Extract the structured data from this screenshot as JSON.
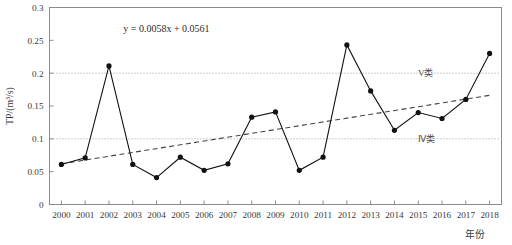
{
  "chart_data": {
    "type": "line",
    "title": "",
    "xlabel": "年份",
    "ylabel": "TP/(m³/s)",
    "xlim": [
      1999.5,
      2018.5
    ],
    "ylim": [
      0,
      0.3
    ],
    "ytick_values": [
      0,
      0.05,
      0.1,
      0.15,
      0.2,
      0.25,
      0.3
    ],
    "ytick_labels": [
      "0",
      "0.05",
      "0.1",
      "0.15",
      "0.2",
      "0.25",
      "0.3"
    ],
    "grid": false,
    "legend": "none",
    "categories": [
      "2000",
      "2001",
      "2002",
      "2003",
      "2004",
      "2005",
      "2006",
      "2007",
      "2008",
      "2009",
      "2010",
      "2011",
      "2012",
      "2013",
      "2014",
      "2015",
      "2016",
      "2017",
      "2018"
    ],
    "x": [
      2000,
      2001,
      2002,
      2003,
      2004,
      2005,
      2006,
      2007,
      2008,
      2009,
      2010,
      2011,
      2012,
      2013,
      2014,
      2015,
      2016,
      2017,
      2018
    ],
    "values": [
      0.061,
      0.071,
      0.211,
      0.061,
      0.041,
      0.072,
      0.052,
      0.062,
      0.133,
      0.141,
      0.052,
      0.072,
      0.243,
      0.173,
      0.113,
      0.14,
      0.131,
      0.16,
      0.23
    ],
    "series": [
      {
        "name": "TP",
        "style": "line-marker",
        "marker": "filled-circle",
        "color": "#111111",
        "values": [
          0.061,
          0.071,
          0.211,
          0.061,
          0.041,
          0.072,
          0.052,
          0.062,
          0.133,
          0.141,
          0.052,
          0.072,
          0.243,
          0.173,
          0.113,
          0.14,
          0.131,
          0.16,
          0.23
        ]
      }
    ],
    "trendline": {
      "name": "linear-trend",
      "equation": "y = 0.0058x + 0.0561",
      "slope": 0.0058,
      "intercept": 0.0561,
      "style": "dashed",
      "color": "#444444",
      "x_basis": "index-from-1",
      "y_start": 0.0619,
      "y_end": 0.1663
    },
    "reference_lines": [
      {
        "label": "V类",
        "value": 0.2,
        "style": "dotted",
        "color": "#9a9a9a"
      },
      {
        "label": "Ⅳ类",
        "value": 0.1,
        "style": "dotted",
        "color": "#9a9a9a"
      }
    ],
    "annotations": [
      {
        "name": "regression-equation",
        "text": "y = 0.0058x + 0.0561",
        "x": 2002.6,
        "y": 0.262
      }
    ]
  },
  "colors": {
    "frame": "#8c8c8c",
    "series": "#111111",
    "trend": "#444444",
    "reference": "#9a9a9a",
    "text": "#3a3a3a",
    "background": "#ffffff"
  }
}
